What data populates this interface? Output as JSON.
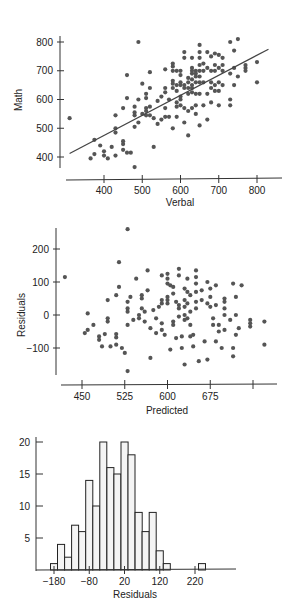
{
  "chart_data": [
    {
      "type": "scatter",
      "title": "",
      "xlabel": "Verbal",
      "ylabel": "Math",
      "xlim": [
        300,
        850
      ],
      "ylim": [
        350,
        820
      ],
      "xticks": [
        400,
        500,
        600,
        700,
        800
      ],
      "yticks": [
        400,
        500,
        600,
        700,
        800
      ],
      "regression_line": {
        "x": [
          310,
          830
        ],
        "y": [
          412,
          775
        ]
      },
      "points": [
        [
          310,
          535
        ],
        [
          365,
          395
        ],
        [
          375,
          460
        ],
        [
          375,
          410
        ],
        [
          390,
          440
        ],
        [
          400,
          420
        ],
        [
          400,
          405
        ],
        [
          410,
          395
        ],
        [
          420,
          435
        ],
        [
          430,
          545
        ],
        [
          430,
          500
        ],
        [
          430,
          485
        ],
        [
          430,
          405
        ],
        [
          450,
          455
        ],
        [
          450,
          445
        ],
        [
          450,
          425
        ],
        [
          450,
          570
        ],
        [
          460,
          685
        ],
        [
          460,
          605
        ],
        [
          460,
          415
        ],
        [
          470,
          415
        ],
        [
          480,
          575
        ],
        [
          480,
          555
        ],
        [
          480,
          545
        ],
        [
          480,
          505
        ],
        [
          480,
          365
        ],
        [
          490,
          800
        ],
        [
          490,
          600
        ],
        [
          490,
          520
        ],
        [
          500,
          655
        ],
        [
          500,
          550
        ],
        [
          510,
          620
        ],
        [
          510,
          605
        ],
        [
          510,
          570
        ],
        [
          510,
          560
        ],
        [
          510,
          545
        ],
        [
          520,
          695
        ],
        [
          520,
          640
        ],
        [
          520,
          545
        ],
        [
          520,
          575
        ],
        [
          530,
          535
        ],
        [
          530,
          435
        ],
        [
          540,
          595
        ],
        [
          540,
          515
        ],
        [
          550,
          610
        ],
        [
          550,
          530
        ],
        [
          560,
          705
        ],
        [
          560,
          640
        ],
        [
          560,
          625
        ],
        [
          560,
          570
        ],
        [
          560,
          540
        ],
        [
          570,
          600
        ],
        [
          570,
          540
        ],
        [
          580,
          725
        ],
        [
          580,
          715
        ],
        [
          580,
          700
        ],
        [
          580,
          665
        ],
        [
          580,
          655
        ],
        [
          580,
          640
        ],
        [
          580,
          500
        ],
        [
          590,
          700
        ],
        [
          590,
          650
        ],
        [
          590,
          630
        ],
        [
          590,
          590
        ],
        [
          590,
          575
        ],
        [
          590,
          540
        ],
        [
          600,
          700
        ],
        [
          600,
          685
        ],
        [
          600,
          660
        ],
        [
          600,
          650
        ],
        [
          600,
          610
        ],
        [
          600,
          600
        ],
        [
          600,
          580
        ],
        [
          610,
          765
        ],
        [
          610,
          745
        ],
        [
          610,
          650
        ],
        [
          610,
          640
        ],
        [
          610,
          520
        ],
        [
          610,
          570
        ],
        [
          620,
          675
        ],
        [
          620,
          660
        ],
        [
          620,
          640
        ],
        [
          620,
          620
        ],
        [
          620,
          560
        ],
        [
          620,
          475
        ],
        [
          630,
          745
        ],
        [
          630,
          710
        ],
        [
          630,
          700
        ],
        [
          630,
          690
        ],
        [
          630,
          670
        ],
        [
          630,
          650
        ],
        [
          630,
          640
        ],
        [
          630,
          625
        ],
        [
          630,
          570
        ],
        [
          640,
          700
        ],
        [
          640,
          690
        ],
        [
          640,
          680
        ],
        [
          640,
          660
        ],
        [
          640,
          620
        ],
        [
          640,
          580
        ],
        [
          640,
          550
        ],
        [
          650,
          790
        ],
        [
          650,
          765
        ],
        [
          650,
          745
        ],
        [
          650,
          720
        ],
        [
          650,
          700
        ],
        [
          650,
          680
        ],
        [
          650,
          660
        ],
        [
          650,
          620
        ],
        [
          650,
          510
        ],
        [
          660,
          725
        ],
        [
          660,
          700
        ],
        [
          660,
          660
        ],
        [
          660,
          580
        ],
        [
          670,
          765
        ],
        [
          670,
          710
        ],
        [
          670,
          620
        ],
        [
          670,
          530
        ],
        [
          680,
          750
        ],
        [
          680,
          700
        ],
        [
          680,
          660
        ],
        [
          680,
          640
        ],
        [
          680,
          590
        ],
        [
          690,
          760
        ],
        [
          690,
          720
        ],
        [
          690,
          700
        ],
        [
          690,
          650
        ],
        [
          690,
          630
        ],
        [
          700,
          755
        ],
        [
          700,
          710
        ],
        [
          700,
          660
        ],
        [
          700,
          630
        ],
        [
          700,
          580
        ],
        [
          710,
          745
        ],
        [
          710,
          720
        ],
        [
          710,
          700
        ],
        [
          710,
          650
        ],
        [
          730,
          800
        ],
        [
          730,
          690
        ],
        [
          730,
          600
        ],
        [
          730,
          580
        ],
        [
          740,
          770
        ],
        [
          740,
          710
        ],
        [
          740,
          650
        ],
        [
          750,
          810
        ],
        [
          750,
          680
        ],
        [
          770,
          720
        ],
        [
          770,
          710
        ],
        [
          770,
          700
        ],
        [
          800,
          730
        ],
        [
          800,
          660
        ]
      ]
    },
    {
      "type": "scatter",
      "title": "",
      "xlabel": "Predicted",
      "ylabel": "Residuals",
      "xlim": [
        415,
        790
      ],
      "ylim": [
        -180,
        270
      ],
      "xticks": [
        450,
        525,
        600,
        675,
        750
      ],
      "xtick_labels": [
        "450",
        "525",
        "600",
        "675",
        ""
      ],
      "yticks": [
        -100,
        0,
        100,
        200
      ],
      "points": [
        [
          420,
          115
        ],
        [
          455,
          -55
        ],
        [
          460,
          5
        ],
        [
          460,
          -45
        ],
        [
          470,
          -30
        ],
        [
          480,
          -65
        ],
        [
          480,
          -75
        ],
        [
          485,
          -95
        ],
        [
          490,
          -58
        ],
        [
          495,
          45
        ],
        [
          495,
          -10
        ],
        [
          495,
          -20
        ],
        [
          500,
          -95
        ],
        [
          510,
          60
        ],
        [
          510,
          -58
        ],
        [
          510,
          -68
        ],
        [
          510,
          -90
        ],
        [
          515,
          160
        ],
        [
          515,
          85
        ],
        [
          520,
          -100
        ],
        [
          525,
          -115
        ],
        [
          530,
          260
        ],
        [
          530,
          40
        ],
        [
          530,
          20
        ],
        [
          530,
          10
        ],
        [
          530,
          -30
        ],
        [
          530,
          -170
        ],
        [
          535,
          55
        ],
        [
          540,
          -15
        ],
        [
          545,
          110
        ],
        [
          550,
          0
        ],
        [
          550,
          -10
        ],
        [
          555,
          60
        ],
        [
          555,
          50
        ],
        [
          555,
          20
        ],
        [
          560,
          -20
        ],
        [
          560,
          10
        ],
        [
          565,
          135
        ],
        [
          565,
          75
        ],
        [
          570,
          -40
        ],
        [
          570,
          -130
        ],
        [
          575,
          15
        ],
        [
          580,
          -10
        ],
        [
          580,
          -55
        ],
        [
          585,
          25
        ],
        [
          590,
          120
        ],
        [
          590,
          45
        ],
        [
          590,
          35
        ],
        [
          590,
          -25
        ],
        [
          590,
          -45
        ],
        [
          595,
          -60
        ],
        [
          600,
          125
        ],
        [
          600,
          110
        ],
        [
          600,
          95
        ],
        [
          600,
          55
        ],
        [
          600,
          45
        ],
        [
          600,
          35
        ],
        [
          605,
          90
        ],
        [
          605,
          -105
        ],
        [
          610,
          85
        ],
        [
          610,
          65
        ],
        [
          610,
          -20
        ],
        [
          610,
          -30
        ],
        [
          615,
          40
        ],
        [
          615,
          -70
        ],
        [
          620,
          140
        ],
        [
          620,
          120
        ],
        [
          620,
          30
        ],
        [
          620,
          20
        ],
        [
          620,
          -5
        ],
        [
          625,
          -65
        ],
        [
          625,
          -100
        ],
        [
          630,
          80
        ],
        [
          630,
          45
        ],
        [
          630,
          25
        ],
        [
          630,
          0
        ],
        [
          630,
          -15
        ],
        [
          630,
          -150
        ],
        [
          635,
          110
        ],
        [
          635,
          70
        ],
        [
          635,
          35
        ],
        [
          635,
          -10
        ],
        [
          640,
          60
        ],
        [
          640,
          10
        ],
        [
          640,
          -30
        ],
        [
          640,
          -65
        ],
        [
          645,
          -60
        ],
        [
          645,
          -95
        ],
        [
          650,
          135
        ],
        [
          650,
          115
        ],
        [
          650,
          95
        ],
        [
          650,
          70
        ],
        [
          650,
          40
        ],
        [
          650,
          20
        ],
        [
          655,
          -140
        ],
        [
          660,
          75
        ],
        [
          660,
          45
        ],
        [
          665,
          -80
        ],
        [
          670,
          100
        ],
        [
          670,
          35
        ],
        [
          670,
          -135
        ],
        [
          675,
          80
        ],
        [
          675,
          55
        ],
        [
          675,
          25
        ],
        [
          680,
          -10
        ],
        [
          680,
          -30
        ],
        [
          685,
          90
        ],
        [
          685,
          30
        ],
        [
          685,
          -80
        ],
        [
          690,
          -30
        ],
        [
          690,
          -50
        ],
        [
          695,
          -100
        ],
        [
          700,
          50
        ],
        [
          700,
          40
        ],
        [
          700,
          20
        ],
        [
          700,
          0
        ],
        [
          700,
          -45
        ],
        [
          710,
          -15
        ],
        [
          715,
          95
        ],
        [
          715,
          -100
        ],
        [
          715,
          -125
        ],
        [
          720,
          55
        ],
        [
          720,
          0
        ],
        [
          720,
          -60
        ],
        [
          725,
          -40
        ],
        [
          730,
          90
        ],
        [
          745,
          -15
        ],
        [
          745,
          -25
        ],
        [
          745,
          -35
        ],
        [
          770,
          -20
        ],
        [
          770,
          -90
        ]
      ]
    },
    {
      "type": "bar",
      "subtype": "histogram",
      "title": "",
      "xlabel": "Residuals",
      "ylabel": "",
      "bin_width": 20,
      "bin_start": -190,
      "xticks": [
        -180,
        -80,
        20,
        120,
        220
      ],
      "yticks": [
        5,
        10,
        15,
        20
      ],
      "ylim": [
        0,
        21
      ],
      "categories": [
        -180,
        -160,
        -140,
        -120,
        -100,
        -80,
        -60,
        -40,
        -20,
        0,
        20,
        40,
        60,
        80,
        100,
        120,
        140,
        160,
        180,
        200,
        220,
        240,
        260
      ],
      "values": [
        1,
        4,
        2,
        7,
        6,
        14,
        10,
        20,
        16,
        15,
        20,
        18,
        9,
        6,
        9,
        3,
        1,
        0,
        0,
        0,
        0,
        1
      ]
    }
  ],
  "labels": {
    "plot1_xlabel": "Verbal",
    "plot1_ylabel": "Math",
    "plot2_xlabel": "Predicted",
    "plot2_ylabel": "Residuals",
    "plot3_xlabel": "Residuals"
  }
}
